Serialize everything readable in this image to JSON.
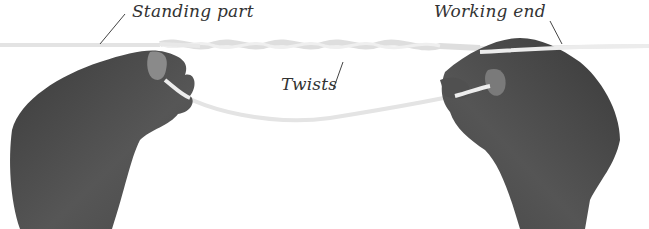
{
  "figure": {
    "labels": {
      "standing_part": "Standing part",
      "twists": "Twists",
      "working_end": "Working end"
    },
    "colors": {
      "background": "#ffffff",
      "hand": "#4a4a4a",
      "cord": "#e6e6e6",
      "label_text": "#333333",
      "leader_line": "#444444"
    }
  }
}
